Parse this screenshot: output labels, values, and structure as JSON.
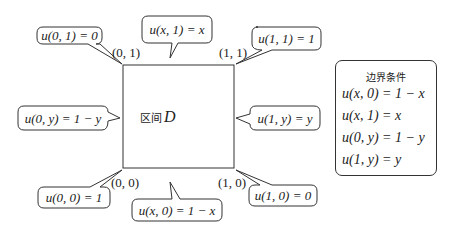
{
  "region": {
    "label_cn": "区间",
    "label_symbol": "D"
  },
  "corners": {
    "top_left": "(0, 1)",
    "top_right": "(1, 1)",
    "bottom_left": "(0, 0)",
    "bottom_right": "(1, 0)"
  },
  "bubbles": {
    "u01": "u(0, 1) = 0",
    "ux1": "u(x, 1) = x",
    "u11": "u(1, 1) = 1",
    "u0y": "u(0, y) = 1 − y",
    "u1y": "u(1, y) = y",
    "u00": "u(0, 0) = 1",
    "ux0": "u(x, 0) = 1 − x",
    "u10": "u(1, 0) = 0"
  },
  "legend": {
    "title": "边界条件",
    "items": [
      "u(x, 0) = 1 − x",
      "u(x, 1) = x",
      "u(0, y) = 1 − y",
      "u(1, y) = y"
    ]
  },
  "colors": {
    "stroke": "#333333",
    "text": "#222222",
    "background": "#ffffff"
  }
}
